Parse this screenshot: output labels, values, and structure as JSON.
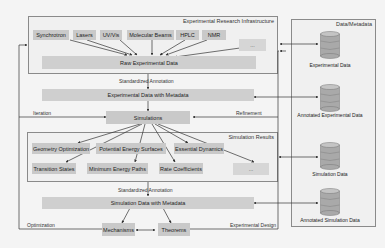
{
  "groups": {
    "infrastructure": {
      "title": "Experimental Research Infrastructure"
    },
    "simulation_results": {
      "title": "Simulation Results"
    },
    "data_metadata": {
      "title": "Data/Metadata"
    }
  },
  "instruments": [
    {
      "label": "Synchrotron"
    },
    {
      "label": "Lasers"
    },
    {
      "label": "UV/Vis"
    },
    {
      "label": "Molecular Beams"
    },
    {
      "label": "HPLC"
    },
    {
      "label": "NMR"
    },
    {
      "label": "..."
    }
  ],
  "nodes": {
    "raw_data": "Raw Experimental Data",
    "exp_metadata": "Experimental Data with Metadata",
    "simulations": "Simulations",
    "sim_metadata": "Simulation Data with Metadata",
    "mechanisms": "Mechanisms",
    "theorems": "Theorems"
  },
  "simulation_results": [
    {
      "label": "Geometry Optimization"
    },
    {
      "label": "Potential Energy Surfaces"
    },
    {
      "label": "Essential Dynamics"
    },
    {
      "label": "Transition States"
    },
    {
      "label": "Minimum Energy Paths"
    },
    {
      "label": "Rate Coefficients"
    },
    {
      "label": "..."
    }
  ],
  "edge_labels": {
    "standardized_annotation_1": "Standardized Annotation",
    "standardized_annotation_2": "Standardized Annotation",
    "iteration": "Iteration",
    "refinement": "Refinement",
    "optimization": "Optimization",
    "experimental_design": "Experimental Design"
  },
  "databases": [
    {
      "label": "Experimental Data"
    },
    {
      "label": "Annotated Experimental Data"
    },
    {
      "label": "Simulation Data"
    },
    {
      "label": "Annotated Simulation Data"
    }
  ],
  "colors": {
    "node_fill": "#c9c9c9",
    "group_fill": "#f0f0f0",
    "border": "#8a8a8a",
    "line": "#333333",
    "db_top": "#bdbdbd",
    "db_body": "#a9a9a9"
  }
}
